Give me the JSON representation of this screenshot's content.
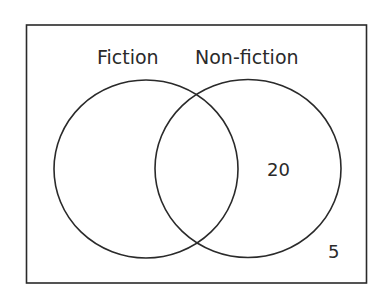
{
  "diagram": {
    "type": "venn",
    "sets": [
      {
        "name": "Fiction",
        "label": "Fiction",
        "only_value": ""
      },
      {
        "name": "Non-fiction",
        "label": "Non-fiction",
        "only_value": "20"
      }
    ],
    "intersection_value": "",
    "outside_value": "5",
    "colors": {
      "stroke": "#2a2a2a",
      "background": "#ffffff"
    }
  }
}
